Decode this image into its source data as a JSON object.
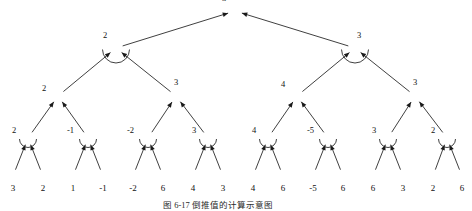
{
  "figure": {
    "caption": "图 6-17   倒推值的计算示意图",
    "caption_x": 163,
    "caption_y": 198,
    "width": 472,
    "height": 211,
    "background": "#ffffff",
    "stroke_color": "#1a1a1a",
    "text_color": "#111111"
  },
  "chart_data": {
    "type": "diagram",
    "diagram_kind": "minimax-game-tree",
    "title": "图 6-17   倒推值的计算示意图",
    "levels": 5,
    "leaf_count": 16,
    "node_radius": 6.2,
    "leaf_radius": 6.0,
    "nodes": [
      {
        "id": "root",
        "level": 0,
        "x": 235,
        "y": 11,
        "value": "3",
        "label_dx": -10,
        "label_dy": -6,
        "arc": false
      },
      {
        "id": "n1",
        "level": 1,
        "x": 116,
        "y": 48,
        "value": "2",
        "label_dx": -10,
        "label_dy": -6,
        "arc": true
      },
      {
        "id": "n2",
        "level": 1,
        "x": 355,
        "y": 48,
        "value": "3",
        "label_dx": 5,
        "label_dy": -6,
        "arc": true
      },
      {
        "id": "n11",
        "level": 2,
        "x": 58,
        "y": 96,
        "value": "2",
        "label_dx": -13,
        "label_dy": -1,
        "arc": false
      },
      {
        "id": "n12",
        "level": 2,
        "x": 176,
        "y": 96,
        "value": "3",
        "label_dx": 1,
        "label_dy": -7,
        "arc": false
      },
      {
        "id": "n21",
        "level": 2,
        "x": 297,
        "y": 96,
        "value": "4",
        "label_dx": -13,
        "label_dy": -5,
        "arc": false
      },
      {
        "id": "n22",
        "level": 2,
        "x": 415,
        "y": 96,
        "value": "3",
        "label_dx": 1,
        "label_dy": -7,
        "arc": false
      },
      {
        "id": "m1",
        "level": 3,
        "x": 28,
        "y": 138,
        "value": "2",
        "label_dx": -13,
        "label_dy": -1,
        "arc": true
      },
      {
        "id": "m2",
        "level": 3,
        "x": 88,
        "y": 138,
        "value": "-1",
        "label_dx": -18,
        "label_dy": -1,
        "arc": true
      },
      {
        "id": "m3",
        "level": 3,
        "x": 148,
        "y": 138,
        "value": "-2",
        "label_dx": -18,
        "label_dy": -1,
        "arc": true
      },
      {
        "id": "m4",
        "level": 3,
        "x": 208,
        "y": 138,
        "value": "3",
        "label_dx": -13,
        "label_dy": -1,
        "arc": true
      },
      {
        "id": "m5",
        "level": 3,
        "x": 268,
        "y": 138,
        "value": "4",
        "label_dx": -13,
        "label_dy": -1,
        "arc": true
      },
      {
        "id": "m6",
        "level": 3,
        "x": 328,
        "y": 138,
        "value": "-5",
        "label_dx": -18,
        "label_dy": -1,
        "arc": true
      },
      {
        "id": "m7",
        "level": 3,
        "x": 388,
        "y": 138,
        "value": "3",
        "label_dx": -13,
        "label_dy": -1,
        "arc": true
      },
      {
        "id": "m8",
        "level": 3,
        "x": 447,
        "y": 138,
        "value": "2",
        "label_dx": -13,
        "label_dy": -1,
        "arc": true
      }
    ],
    "leaves": [
      {
        "id": "L1",
        "x": 13,
        "y": 176,
        "value": "3"
      },
      {
        "id": "L2",
        "x": 43,
        "y": 176,
        "value": "2"
      },
      {
        "id": "L3",
        "x": 73,
        "y": 176,
        "value": "1"
      },
      {
        "id": "L4",
        "x": 103,
        "y": 176,
        "value": "-1"
      },
      {
        "id": "L5",
        "x": 133,
        "y": 176,
        "value": "-2"
      },
      {
        "id": "L6",
        "x": 163,
        "y": 176,
        "value": "6"
      },
      {
        "id": "L7",
        "x": 193,
        "y": 176,
        "value": "4"
      },
      {
        "id": "L8",
        "x": 223,
        "y": 176,
        "value": "3"
      },
      {
        "id": "L9",
        "x": 253,
        "y": 176,
        "value": "4"
      },
      {
        "id": "L10",
        "x": 283,
        "y": 176,
        "value": "6"
      },
      {
        "id": "L11",
        "x": 313,
        "y": 176,
        "value": "-5"
      },
      {
        "id": "L12",
        "x": 343,
        "y": 176,
        "value": "6"
      },
      {
        "id": "L13",
        "x": 373,
        "y": 176,
        "value": "6"
      },
      {
        "id": "L14",
        "x": 403,
        "y": 176,
        "value": "3"
      },
      {
        "id": "L15",
        "x": 433,
        "y": 176,
        "value": "2"
      },
      {
        "id": "L16",
        "x": 462,
        "y": 176,
        "value": "6"
      }
    ],
    "edges": [
      {
        "from": "n1",
        "to": "root",
        "arrow_at": "root"
      },
      {
        "from": "n2",
        "to": "root",
        "arrow_at": "root"
      },
      {
        "from": "n11",
        "to": "n1",
        "arrow_at": "n1"
      },
      {
        "from": "n12",
        "to": "n1",
        "arrow_at": "n1"
      },
      {
        "from": "n21",
        "to": "n2",
        "arrow_at": "n2"
      },
      {
        "from": "n22",
        "to": "n2",
        "arrow_at": "n2"
      },
      {
        "from": "m1",
        "to": "n11",
        "arrow_at": "n11"
      },
      {
        "from": "m2",
        "to": "n11",
        "arrow_at": "n11"
      },
      {
        "from": "m3",
        "to": "n12",
        "arrow_at": "n12"
      },
      {
        "from": "m4",
        "to": "n12",
        "arrow_at": "n12"
      },
      {
        "from": "m5",
        "to": "n21",
        "arrow_at": "n21"
      },
      {
        "from": "m6",
        "to": "n21",
        "arrow_at": "n21"
      },
      {
        "from": "m7",
        "to": "n22",
        "arrow_at": "n22"
      },
      {
        "from": "m8",
        "to": "n22",
        "arrow_at": "n22"
      },
      {
        "from": "L1",
        "to": "m1",
        "arrow_at": "m1"
      },
      {
        "from": "L2",
        "to": "m1",
        "arrow_at": "m1"
      },
      {
        "from": "L3",
        "to": "m2",
        "arrow_at": "m2"
      },
      {
        "from": "L4",
        "to": "m2",
        "arrow_at": "m2"
      },
      {
        "from": "L5",
        "to": "m3",
        "arrow_at": "m3"
      },
      {
        "from": "L6",
        "to": "m3",
        "arrow_at": "m3"
      },
      {
        "from": "L7",
        "to": "m4",
        "arrow_at": "m4"
      },
      {
        "from": "L8",
        "to": "m4",
        "arrow_at": "m4"
      },
      {
        "from": "L9",
        "to": "m5",
        "arrow_at": "m5"
      },
      {
        "from": "L10",
        "to": "m5",
        "arrow_at": "m5"
      },
      {
        "from": "L11",
        "to": "m6",
        "arrow_at": "m6"
      },
      {
        "from": "L12",
        "to": "m6",
        "arrow_at": "m6"
      },
      {
        "from": "L13",
        "to": "m7",
        "arrow_at": "m7"
      },
      {
        "from": "L14",
        "to": "m7",
        "arrow_at": "m7"
      },
      {
        "from": "L15",
        "to": "m8",
        "arrow_at": "m8"
      },
      {
        "from": "L16",
        "to": "m8",
        "arrow_at": "m8"
      }
    ]
  }
}
